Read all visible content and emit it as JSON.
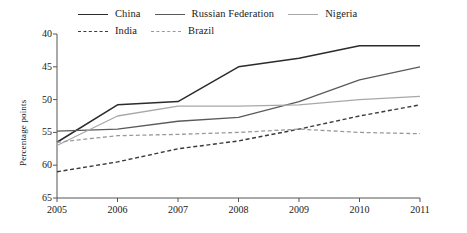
{
  "chart_data": {
    "type": "line",
    "title": "",
    "xlabel": "",
    "ylabel": "Percentage points",
    "x": [
      "2005",
      "2006",
      "2007",
      "2008",
      "2009",
      "2010",
      "2011"
    ],
    "xtick_labels": [
      "2005",
      "2006",
      "2007",
      "2008",
      "2009",
      "2010",
      "2011"
    ],
    "ytick_labels": [
      "40",
      "45",
      "50",
      "55",
      "60",
      "65"
    ],
    "ylim": [
      65,
      40
    ],
    "y_axis_inverted": true,
    "grid": false,
    "legend_position": "top",
    "series": [
      {
        "name": "China",
        "color": "#2b2b2b",
        "style": "solid",
        "width": 1.5,
        "values": [
          56.5,
          50.8,
          50.3,
          45.0,
          43.7,
          41.8,
          41.8
        ]
      },
      {
        "name": "Russian Federation",
        "color": "#5a5a5a",
        "style": "solid",
        "width": 1.3,
        "values": [
          54.8,
          54.5,
          53.3,
          52.7,
          50.3,
          47.0,
          45.0
        ]
      },
      {
        "name": "Nigeria",
        "color": "#a8a8a8",
        "style": "solid",
        "width": 1.3,
        "values": [
          57.0,
          52.5,
          51.0,
          51.0,
          50.8,
          50.0,
          49.5
        ]
      },
      {
        "name": "India",
        "color": "#3a3a3a",
        "style": "dashed",
        "width": 1.4,
        "values": [
          61.0,
          59.5,
          57.5,
          56.3,
          54.5,
          52.5,
          50.8
        ]
      },
      {
        "name": "Brazil",
        "color": "#9a9a9a",
        "style": "dashed",
        "width": 1.3,
        "values": [
          56.5,
          55.5,
          55.3,
          55.0,
          54.5,
          55.0,
          55.2
        ]
      }
    ]
  },
  "legend": {
    "rows": [
      [
        {
          "label": "China",
          "color": "#2b2b2b",
          "style": "solid"
        },
        {
          "label": "Russian Federation",
          "color": "#5a5a5a",
          "style": "solid"
        },
        {
          "label": "Nigeria",
          "color": "#a8a8a8",
          "style": "solid"
        }
      ],
      [
        {
          "label": "India",
          "color": "#3a3a3a",
          "style": "dashed"
        },
        {
          "label": "Brazil",
          "color": "#9a9a9a",
          "style": "dashed"
        }
      ]
    ]
  },
  "axes": {
    "y_title": "Percentage points"
  }
}
